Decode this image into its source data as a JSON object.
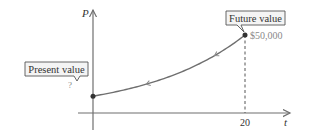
{
  "chart_data": {
    "type": "line",
    "title": "",
    "xlabel": "t",
    "ylabel": "P",
    "x_ticks": [
      {
        "value": 20,
        "label": "20"
      }
    ],
    "xlim": [
      0,
      22.5
    ],
    "ylim": [
      0,
      55000
    ],
    "series": [
      {
        "name": "value over time",
        "points": [
          [
            0,
            10800
          ],
          [
            5,
            13500
          ],
          [
            10,
            18500
          ],
          [
            15,
            28000
          ],
          [
            20,
            50000
          ]
        ]
      }
    ],
    "grid": false,
    "direction_arrows": "pointing toward t = 0",
    "annotations": [
      {
        "id": "present",
        "label": "Present value",
        "value_text": "?",
        "x": 0
      },
      {
        "id": "future",
        "label": "Future value",
        "value_text": "$50,000",
        "x": 20,
        "y": 50000
      }
    ]
  }
}
